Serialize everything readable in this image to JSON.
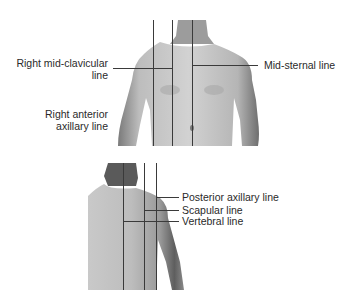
{
  "figures": {
    "anterior": {
      "description": "Anterior chest with vertical reference lines",
      "labels": {
        "right_mid_clavicular_line_1": "Right mid-clavicular",
        "right_mid_clavicular_line_2": "line",
        "right_anterior_axillary_line_1": "Right anterior",
        "right_anterior_axillary_line_2": "axillary line",
        "mid_sternal_line": "Mid-sternal line"
      }
    },
    "posterior": {
      "description": "Posterior chest with vertical reference lines",
      "labels": {
        "posterior_axillary_line": "Posterior axillary line",
        "scapular_line": "Scapular line",
        "vertebral_line": "Vertebral line"
      }
    }
  },
  "colors": {
    "line": "#3a3a3a",
    "skin_light": "#d8d8d8",
    "skin_dark": "#8a8a8a",
    "text": "#2a2a2a"
  }
}
